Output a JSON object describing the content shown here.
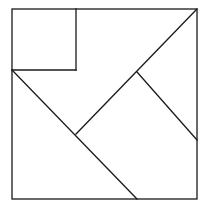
{
  "diagram": {
    "type": "tangram-square-dissection",
    "stroke_color": "#1a1a1a",
    "background": "#ffffff",
    "outer_square": {
      "x1": 12,
      "y1": 9,
      "x2": 197,
      "y2": 199
    },
    "segments": [
      {
        "name": "small-square-right-edge",
        "x1": 76,
        "y1": 9,
        "x2": 76,
        "y2": 70
      },
      {
        "name": "small-square-bottom-edge",
        "x1": 12,
        "y1": 70,
        "x2": 76,
        "y2": 70
      },
      {
        "name": "long-diagonal-left",
        "x1": 12,
        "y1": 70,
        "x2": 137,
        "y2": 199
      },
      {
        "name": "diagonal-upper",
        "x1": 76,
        "y1": 134,
        "x2": 197,
        "y2": 9
      },
      {
        "name": "diagonal-right",
        "x1": 137,
        "y1": 72,
        "x2": 197,
        "y2": 140
      }
    ]
  }
}
